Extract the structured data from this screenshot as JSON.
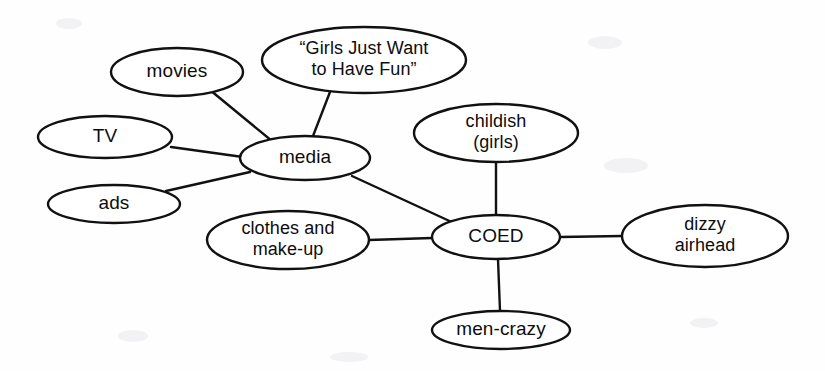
{
  "diagram": {
    "type": "concept-map",
    "background_color": "#fefefe",
    "stroke_color": "#111111",
    "text_color": "#0d0d0d",
    "width": 825,
    "height": 371,
    "nodes": [
      {
        "id": "movies",
        "label": "movies",
        "lines": [
          "movies"
        ],
        "cx": 177,
        "cy": 72,
        "rx": 66,
        "ry": 24
      },
      {
        "id": "song",
        "label": "“Girls Just Want to Have Fun”",
        "lines": [
          "“Girls Just Want",
          "to Have Fun”"
        ],
        "cx": 364,
        "cy": 60,
        "rx": 102,
        "ry": 33
      },
      {
        "id": "tv",
        "label": "TV",
        "lines": [
          "TV"
        ],
        "cx": 105,
        "cy": 137,
        "rx": 67,
        "ry": 21
      },
      {
        "id": "media",
        "label": "media",
        "lines": [
          "media"
        ],
        "cx": 305,
        "cy": 158,
        "rx": 65,
        "ry": 22
      },
      {
        "id": "childish",
        "label": "childish (girls)",
        "lines": [
          "childish",
          "(girls)"
        ],
        "cx": 496,
        "cy": 133,
        "rx": 82,
        "ry": 29
      },
      {
        "id": "ads",
        "label": "ads",
        "lines": [
          "ads"
        ],
        "cx": 114,
        "cy": 204,
        "rx": 66,
        "ry": 19
      },
      {
        "id": "clothes",
        "label": "clothes and make-up",
        "lines": [
          "clothes and",
          "make-up"
        ],
        "cx": 288,
        "cy": 240,
        "rx": 81,
        "ry": 29
      },
      {
        "id": "coed",
        "label": "COED",
        "lines": [
          "COED"
        ],
        "cx": 496,
        "cy": 237,
        "rx": 64,
        "ry": 22
      },
      {
        "id": "dizzy",
        "label": "dizzy airhead",
        "lines": [
          "dizzy",
          "airhead"
        ],
        "cx": 705,
        "cy": 236,
        "rx": 83,
        "ry": 31
      },
      {
        "id": "mencrazy",
        "label": "men-crazy",
        "lines": [
          "men-crazy"
        ],
        "cx": 501,
        "cy": 330,
        "rx": 69,
        "ry": 19
      }
    ],
    "edges": [
      {
        "id": "edge-movies-media",
        "from": "movies",
        "to": "media",
        "x1": 210,
        "y1": 90,
        "x2": 272,
        "y2": 141
      },
      {
        "id": "edge-song-media",
        "from": "song",
        "to": "media",
        "x1": 330,
        "y1": 92,
        "x2": 313,
        "y2": 136
      },
      {
        "id": "edge-tv-media",
        "from": "tv",
        "to": "media",
        "x1": 171,
        "y1": 147,
        "x2": 243,
        "y2": 157
      },
      {
        "id": "edge-ads-media",
        "from": "ads",
        "to": "media",
        "x1": 166,
        "y1": 191,
        "x2": 250,
        "y2": 172
      },
      {
        "id": "edge-media-coed",
        "from": "media",
        "to": "coed",
        "x1": 352,
        "y1": 176,
        "x2": 456,
        "y2": 224
      },
      {
        "id": "edge-childish-coed",
        "from": "childish",
        "to": "coed",
        "x1": 496,
        "y1": 162,
        "x2": 496,
        "y2": 215
      },
      {
        "id": "edge-clothes-coed",
        "from": "clothes",
        "to": "coed",
        "x1": 369,
        "y1": 240,
        "x2": 432,
        "y2": 238
      },
      {
        "id": "edge-coed-dizzy",
        "from": "coed",
        "to": "dizzy",
        "x1": 560,
        "y1": 237,
        "x2": 622,
        "y2": 236
      },
      {
        "id": "edge-coed-mencrazy",
        "from": "coed",
        "to": "mencrazy",
        "x1": 498,
        "y1": 259,
        "x2": 500,
        "y2": 311
      }
    ]
  }
}
